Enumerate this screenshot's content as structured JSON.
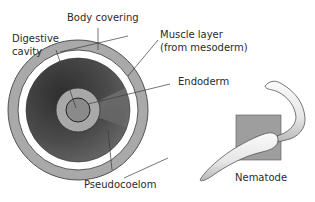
{
  "diagram": {
    "labels": {
      "body_covering": "Body covering",
      "digestive_cavity_line1": "Digestive",
      "digestive_cavity_line2": "cavity",
      "muscle_layer_line1": "Muscle layer",
      "muscle_layer_line2": "(from mesoderm)",
      "endoderm": "Endoderm",
      "pseudocoelom": "Pseudocoelom",
      "nematode": "Nematode"
    },
    "colors": {
      "body_covering": "#a9a9a9",
      "gap": "#ffffff",
      "pseudocoelom_dark": "#3c3c3c",
      "pseudocoelom_light": "#7a7a7a",
      "endoderm": "#a8a8a8",
      "digestive_cavity": "#8a8a8a",
      "inset_box": "#9e9e9e",
      "worm_body": "#e9e9e9",
      "outline": "#444444"
    }
  }
}
